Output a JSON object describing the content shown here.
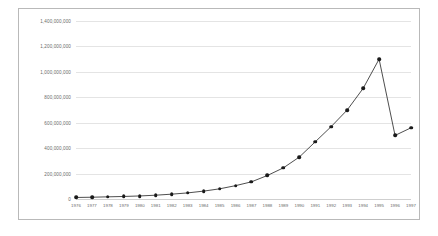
{
  "chart_data": {
    "type": "line",
    "title": "",
    "subtitle": "",
    "xlabel": "",
    "ylabel": "",
    "grid": true,
    "legend": false,
    "legend_position": "none",
    "marker": "filled-circle",
    "line_color": "#3a3a3a",
    "marker_color": "#1a1a1a",
    "gridline_color": "#e4e4e4",
    "background_color": "#ffffff",
    "border_color": "#b9b9b9",
    "text_color": "#6a6a6a",
    "ylim": [
      0,
      1400000000
    ],
    "ytick_interval": 200000000,
    "ytick_labels": [
      "1,400,000,000",
      "1,200,000,000",
      "1,000,000,000",
      "800,000,000",
      "600,000,000",
      "400,000,000",
      "200,000,000",
      "0"
    ],
    "ytick_values": [
      1400000000,
      1200000000,
      1000000000,
      800000000,
      600000000,
      400000000,
      200000000,
      0
    ],
    "categories": [
      "1976",
      "1977",
      "1978",
      "1979",
      "1980",
      "1981",
      "1982",
      "1983",
      "1984",
      "1985",
      "1986",
      "1987",
      "1988",
      "1989",
      "1990",
      "1991",
      "1992",
      "1993",
      "1994",
      "1995",
      "1996",
      "1997"
    ],
    "values": [
      12000000,
      14000000,
      17000000,
      20000000,
      24000000,
      30000000,
      38000000,
      48000000,
      62000000,
      80000000,
      105000000,
      135000000,
      185000000,
      245000000,
      330000000,
      450000000,
      570000000,
      700000000,
      870000000,
      1100000000,
      500000000,
      560000000
    ]
  }
}
